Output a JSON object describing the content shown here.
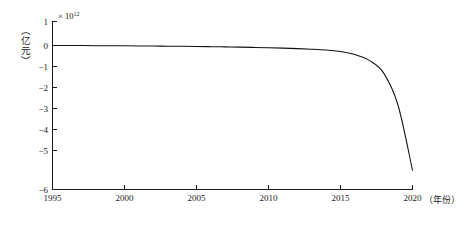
{
  "chart_data": {
    "type": "line",
    "title": "",
    "subtitle": "",
    "xlabel": "（年份）",
    "ylabel": "（亿元）",
    "y_exponent_prefix": "× 10",
    "y_exponent_power": "12",
    "y_scale_note": "× 10^12",
    "xlim": [
      1995,
      2020
    ],
    "ylim": [
      -6,
      1
    ],
    "xticks": [
      1995,
      2000,
      2005,
      2010,
      2015,
      2020
    ],
    "xtick_labels": [
      "1995",
      "2000",
      "2005",
      "2010",
      "2015",
      "2020"
    ],
    "yticks": [
      1,
      0,
      -1,
      -2,
      -3,
      -4,
      -5,
      -6
    ],
    "ytick_labels": [
      "1",
      "0",
      "−1",
      "−2",
      "−3",
      "−4",
      "−5",
      "−6"
    ],
    "grid": false,
    "legend": false,
    "legend_position": "none",
    "series": [
      {
        "name": "累计值",
        "color": "#111111",
        "x": [
          1995,
          1996,
          1997,
          1998,
          1999,
          2000,
          2001,
          2002,
          2003,
          2004,
          2005,
          2006,
          2007,
          2008,
          2009,
          2010,
          2011,
          2012,
          2013,
          2014,
          2015,
          2016,
          2017,
          2018,
          2019,
          2020
        ],
        "values": [
          0.0,
          -0.002,
          -0.004,
          -0.007,
          -0.01,
          -0.014,
          -0.018,
          -0.023,
          -0.028,
          -0.034,
          -0.041,
          -0.049,
          -0.058,
          -0.068,
          -0.08,
          -0.094,
          -0.11,
          -0.13,
          -0.155,
          -0.19,
          -0.25,
          -0.38,
          -0.62,
          -1.15,
          -2.5,
          -5.2
        ]
      }
    ],
    "annotations": []
  },
  "axes": {
    "y_axis_name": "y-axis",
    "x_axis_name": "x-axis"
  }
}
